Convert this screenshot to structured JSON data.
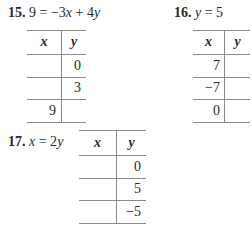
{
  "problems": [
    {
      "number": "15.",
      "equation": "9 = −3x + 4y",
      "table": {
        "headers": [
          "x",
          "y"
        ],
        "rows": [
          [
            "",
            "0"
          ],
          [
            "",
            "3"
          ],
          [
            "9",
            ""
          ]
        ]
      }
    },
    {
      "number": "16.",
      "equation": "y = 5",
      "table": {
        "headers": [
          "x",
          "y"
        ],
        "rows": [
          [
            "7",
            ""
          ],
          [
            "−7",
            ""
          ],
          [
            "0",
            ""
          ]
        ]
      }
    },
    {
      "number": "17.",
      "equation": "x = 2y",
      "table": {
        "headers": [
          "x",
          "y"
        ],
        "rows": [
          [
            "",
            "0"
          ],
          [
            "",
            "5"
          ],
          [
            "",
            "−5"
          ]
        ]
      }
    }
  ]
}
